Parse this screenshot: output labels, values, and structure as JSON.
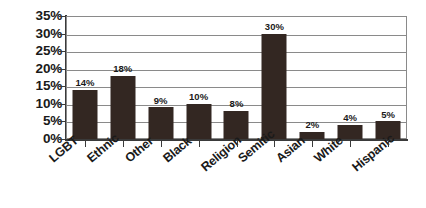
{
  "chart_data": {
    "type": "bar",
    "title": "",
    "subtitle": "",
    "xlabel": "",
    "ylabel": "",
    "categories": [
      "LGBT",
      "Ethnic",
      "Other",
      "Black",
      "Religion",
      "Semitic",
      "Asian",
      "White",
      "Hispanic"
    ],
    "values": [
      14,
      18,
      9,
      10,
      8,
      30,
      2,
      4,
      5
    ],
    "value_labels": [
      "14%",
      "18%",
      "9%",
      "10%",
      "8%",
      "30%",
      "2%",
      "4%",
      "5%"
    ],
    "ylim": [
      0,
      35
    ],
    "ytick_values": [
      0,
      5,
      10,
      15,
      20,
      25,
      30,
      35
    ],
    "ytick_labels": [
      "0%",
      "5%",
      "10%",
      "15%",
      "20%",
      "25%",
      "30%",
      "35%"
    ],
    "grid": true,
    "grid_axis": "y",
    "legend": false,
    "legend_position": "none",
    "series": [
      {
        "name": "",
        "values": [
          14,
          18,
          9,
          10,
          8,
          30,
          2,
          4,
          5
        ],
        "color": "#332722"
      }
    ],
    "annotations": []
  },
  "style": {
    "bar_color": "#332722",
    "grid_color": "#8a8a8a",
    "axis_color": "#3a3a3a",
    "text_color": "#1a1a1a",
    "background": "#ffffff"
  }
}
